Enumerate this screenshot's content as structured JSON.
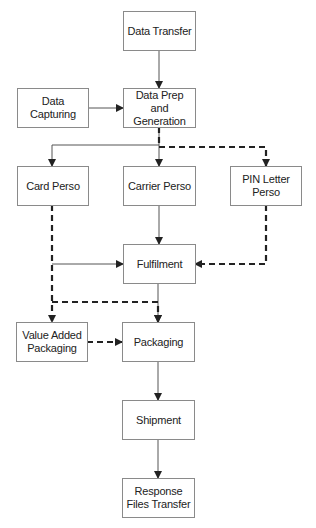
{
  "diagram": {
    "type": "flowchart",
    "nodes": [
      {
        "id": "data_transfer",
        "label": "Data Transfer"
      },
      {
        "id": "data_capturing",
        "label": "Data Capturing"
      },
      {
        "id": "data_prep",
        "label": "Data Prep and Generation"
      },
      {
        "id": "card_perso",
        "label": "Card Perso"
      },
      {
        "id": "carrier_perso",
        "label": "Carrier Perso"
      },
      {
        "id": "pin_letter_perso",
        "label": "PIN Letter Perso"
      },
      {
        "id": "fulfilment",
        "label": "Fulfilment"
      },
      {
        "id": "value_added_packaging",
        "label": "Value Added Packaging"
      },
      {
        "id": "packaging",
        "label": "Packaging"
      },
      {
        "id": "shipment",
        "label": "Shipment"
      },
      {
        "id": "response_files_transfer",
        "label": "Response Files Transfer"
      }
    ],
    "edges": [
      {
        "from": "data_transfer",
        "to": "data_prep",
        "style": "solid"
      },
      {
        "from": "data_capturing",
        "to": "data_prep",
        "style": "solid"
      },
      {
        "from": "data_prep",
        "to": "card_perso",
        "style": "solid"
      },
      {
        "from": "data_prep",
        "to": "carrier_perso",
        "style": "solid"
      },
      {
        "from": "data_prep",
        "to": "pin_letter_perso",
        "style": "dashed"
      },
      {
        "from": "carrier_perso",
        "to": "fulfilment",
        "style": "solid"
      },
      {
        "from": "card_perso",
        "to": "fulfilment",
        "style": "solid"
      },
      {
        "from": "pin_letter_perso",
        "to": "fulfilment",
        "style": "dashed"
      },
      {
        "from": "card_perso",
        "to": "value_added_packaging",
        "style": "dashed"
      },
      {
        "from": "card_perso",
        "to": "packaging",
        "style": "dashed"
      },
      {
        "from": "fulfilment",
        "to": "packaging",
        "style": "solid"
      },
      {
        "from": "value_added_packaging",
        "to": "packaging",
        "style": "dashed"
      },
      {
        "from": "packaging",
        "to": "shipment",
        "style": "solid"
      },
      {
        "from": "shipment",
        "to": "response_files_transfer",
        "style": "solid"
      }
    ]
  }
}
